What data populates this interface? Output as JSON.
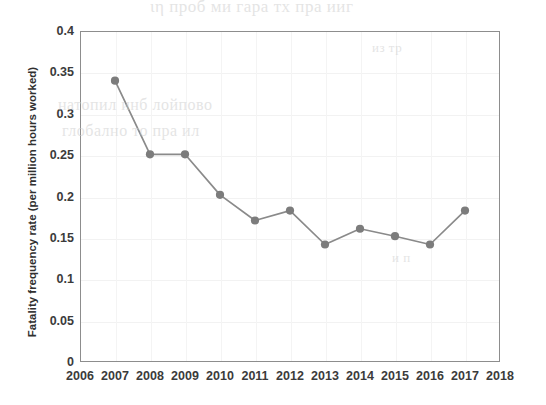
{
  "chart_data": {
    "type": "line",
    "title": "",
    "xlabel": "",
    "ylabel": "Fatality frequency rate (per million hours worked)",
    "x": [
      2007,
      2008,
      2009,
      2010,
      2011,
      2012,
      2013,
      2014,
      2015,
      2016,
      2017
    ],
    "values": [
      0.34,
      0.251,
      0.251,
      0.202,
      0.171,
      0.183,
      0.142,
      0.161,
      0.152,
      0.142,
      0.183
    ],
    "series": [
      {
        "name": "Fatality frequency rate",
        "values": [
          0.34,
          0.251,
          0.251,
          0.202,
          0.171,
          0.183,
          0.142,
          0.161,
          0.152,
          0.142,
          0.183
        ]
      }
    ],
    "xlim": [
      2006,
      2018
    ],
    "ylim": [
      0,
      0.4
    ],
    "xticks": [
      "2006",
      "2007",
      "2008",
      "2009",
      "2010",
      "2011",
      "2012",
      "2013",
      "2014",
      "2015",
      "2016",
      "2017",
      "2018"
    ],
    "yticks": [
      "0",
      "0.05",
      "0.1",
      "0.15",
      "0.2",
      "0.25",
      "0.3",
      "0.35",
      "0.4"
    ],
    "ytick_values": [
      0,
      0.05,
      0.1,
      0.15,
      0.2,
      0.25,
      0.3,
      0.35,
      0.4
    ],
    "grid": true,
    "legend": "none",
    "line_color": "#8a8a8a",
    "marker_color": "#7c7c7c",
    "marker_shape": "circle",
    "axis_color": "#8d8d8d",
    "grid_color": "#f2f2f2",
    "text_color": "#3b3b3b",
    "background_color": "#ffffff"
  },
  "scan_artifacts": {
    "line_a": "ιη проб ми гара тх пра ииг",
    "line_b": "натопил инб лойпово",
    "line_c": "глобално то пра ил",
    "line_d": "из тр",
    "line_e": "и п"
  }
}
